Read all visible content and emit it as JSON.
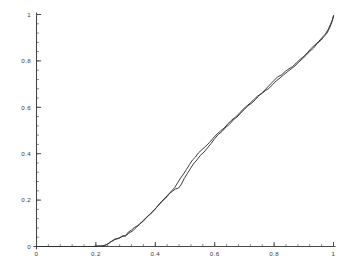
{
  "chart_data": {
    "type": "line",
    "title": "",
    "subtitle": "",
    "xlabel": "",
    "ylabel": "",
    "xlim": [
      0,
      1
    ],
    "ylim": [
      0,
      1
    ],
    "grid": false,
    "legend": "none",
    "background_color": "#ffffff",
    "line_color": "#333333",
    "axis_color": "#4a4a4a",
    "xticks": [
      0,
      0.2,
      0.4,
      0.6,
      0.8,
      1
    ],
    "xticklabels": [
      "0",
      "0.2",
      "0.4",
      "0.6",
      "0.8",
      "1"
    ],
    "yticks": [
      0,
      0.2,
      0.4,
      0.6,
      0.8,
      1
    ],
    "yticklabels": [
      "0",
      "0.2",
      "0.4",
      "0.6",
      "0.8",
      "1"
    ],
    "minor_tick_step": 0.04,
    "series": [
      {
        "name": "curve-1",
        "x": [
          0.0,
          0.05,
          0.1,
          0.15,
          0.19,
          0.21,
          0.22,
          0.235,
          0.25,
          0.262,
          0.275,
          0.288,
          0.3,
          0.31,
          0.32,
          0.33,
          0.342,
          0.355,
          0.368,
          0.38,
          0.392,
          0.405,
          0.418,
          0.43,
          0.442,
          0.455,
          0.465,
          0.475,
          0.485,
          0.495,
          0.505,
          0.515,
          0.525,
          0.535,
          0.545,
          0.558,
          0.57,
          0.582,
          0.595,
          0.608,
          0.62,
          0.632,
          0.645,
          0.658,
          0.67,
          0.682,
          0.695,
          0.708,
          0.72,
          0.732,
          0.745,
          0.758,
          0.77,
          0.782,
          0.795,
          0.808,
          0.82,
          0.832,
          0.845,
          0.858,
          0.87,
          0.882,
          0.895,
          0.908,
          0.92,
          0.932,
          0.945,
          0.958,
          0.968,
          0.978,
          0.988,
          0.995,
          1.0
        ],
        "y": [
          0.0,
          0.0,
          0.0,
          0.0,
          0.0,
          0.002,
          0.005,
          0.01,
          0.018,
          0.028,
          0.036,
          0.042,
          0.05,
          0.062,
          0.072,
          0.08,
          0.092,
          0.106,
          0.12,
          0.136,
          0.152,
          0.17,
          0.186,
          0.204,
          0.222,
          0.24,
          0.256,
          0.272,
          0.292,
          0.312,
          0.332,
          0.352,
          0.372,
          0.388,
          0.4,
          0.416,
          0.432,
          0.448,
          0.466,
          0.482,
          0.498,
          0.512,
          0.528,
          0.545,
          0.56,
          0.574,
          0.59,
          0.604,
          0.618,
          0.632,
          0.646,
          0.66,
          0.672,
          0.684,
          0.698,
          0.712,
          0.726,
          0.742,
          0.756,
          0.768,
          0.78,
          0.792,
          0.806,
          0.822,
          0.838,
          0.854,
          0.872,
          0.89,
          0.904,
          0.92,
          0.944,
          0.968,
          0.992
        ]
      },
      {
        "name": "curve-2",
        "x": [
          0.0,
          0.05,
          0.1,
          0.15,
          0.195,
          0.215,
          0.228,
          0.24,
          0.252,
          0.265,
          0.278,
          0.29,
          0.3,
          0.312,
          0.322,
          0.335,
          0.348,
          0.36,
          0.372,
          0.385,
          0.398,
          0.41,
          0.422,
          0.435,
          0.448,
          0.458,
          0.468,
          0.478,
          0.488,
          0.498,
          0.508,
          0.518,
          0.528,
          0.54,
          0.552,
          0.564,
          0.576,
          0.588,
          0.6,
          0.612,
          0.625,
          0.638,
          0.65,
          0.662,
          0.675,
          0.688,
          0.7,
          0.712,
          0.725,
          0.738,
          0.75,
          0.762,
          0.775,
          0.788,
          0.8,
          0.812,
          0.825,
          0.838,
          0.85,
          0.862,
          0.875,
          0.888,
          0.9,
          0.912,
          0.925,
          0.938,
          0.95,
          0.962,
          0.972,
          0.982,
          0.99,
          0.996,
          1.0
        ],
        "y": [
          0.0,
          0.0,
          0.0,
          0.0,
          0.0,
          0.002,
          0.006,
          0.012,
          0.02,
          0.03,
          0.038,
          0.044,
          0.046,
          0.056,
          0.068,
          0.082,
          0.096,
          0.112,
          0.128,
          0.144,
          0.16,
          0.176,
          0.194,
          0.21,
          0.228,
          0.24,
          0.248,
          0.252,
          0.27,
          0.292,
          0.316,
          0.338,
          0.356,
          0.374,
          0.392,
          0.41,
          0.428,
          0.446,
          0.464,
          0.48,
          0.496,
          0.512,
          0.528,
          0.544,
          0.56,
          0.576,
          0.592,
          0.606,
          0.62,
          0.636,
          0.652,
          0.668,
          0.684,
          0.7,
          0.716,
          0.73,
          0.742,
          0.754,
          0.764,
          0.776,
          0.79,
          0.806,
          0.822,
          0.838,
          0.854,
          0.868,
          0.884,
          0.902,
          0.916,
          0.934,
          0.956,
          0.976,
          0.996
        ]
      }
    ]
  },
  "axes": {
    "x_axis_name": "x-axis",
    "y_axis_name": "y-axis"
  }
}
